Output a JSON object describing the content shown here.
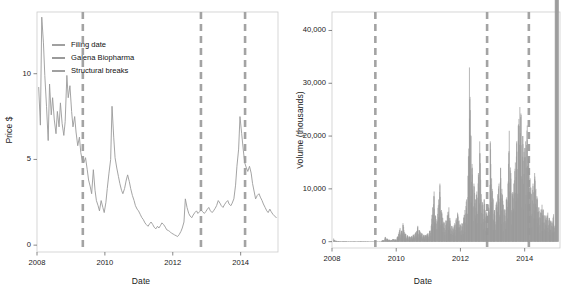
{
  "figure": {
    "background": "#ffffff",
    "series_color": "#9a9a9a",
    "break_color": "#a3a3a3",
    "frame_color": "#cccccc"
  },
  "legend": {
    "items": [
      {
        "label": "Filing date",
        "key": "line-key-filing-date"
      },
      {
        "label": "Galena Biopharma",
        "key": "line-key-galena"
      },
      {
        "label": "Structural breaks",
        "key": "line-key-breaks"
      }
    ]
  },
  "chart_data": [
    {
      "type": "line",
      "id": "price-panel",
      "title": "",
      "xlabel": "Date",
      "ylabel": "Price $",
      "xlim": [
        2008.0,
        2015.1
      ],
      "ylim": [
        -0.4,
        13.6
      ],
      "xticks": [
        2008,
        2010,
        2012,
        2014
      ],
      "xtick_labels": [
        "2008",
        "2010",
        "2012",
        "2014"
      ],
      "yticks": [
        0,
        5,
        10
      ],
      "ytick_labels": [
        "0",
        "5",
        "10"
      ],
      "grid": false,
      "legend_position": "top-left",
      "vlines": [
        2009.35,
        2012.83,
        2014.13
      ],
      "vline_style": "dashed",
      "x": [
        2008.05,
        2008.1,
        2008.14,
        2008.19,
        2008.23,
        2008.28,
        2008.33,
        2008.37,
        2008.42,
        2008.46,
        2008.51,
        2008.56,
        2008.6,
        2008.65,
        2008.69,
        2008.74,
        2008.79,
        2008.83,
        2008.88,
        2008.92,
        2008.97,
        2009.02,
        2009.06,
        2009.11,
        2009.15,
        2009.2,
        2009.25,
        2009.29,
        2009.34,
        2009.38,
        2009.43,
        2009.48,
        2009.52,
        2009.57,
        2009.61,
        2009.66,
        2009.71,
        2009.75,
        2009.8,
        2009.84,
        2009.89,
        2009.94,
        2009.98,
        2010.03,
        2010.07,
        2010.12,
        2010.17,
        2010.21,
        2010.26,
        2010.3,
        2010.35,
        2010.4,
        2010.44,
        2010.49,
        2010.53,
        2010.58,
        2010.63,
        2010.67,
        2010.72,
        2010.76,
        2010.81,
        2010.86,
        2010.9,
        2010.95,
        2010.99,
        2011.04,
        2011.09,
        2011.13,
        2011.18,
        2011.22,
        2011.27,
        2011.32,
        2011.36,
        2011.41,
        2011.45,
        2011.5,
        2011.55,
        2011.59,
        2011.64,
        2011.68,
        2011.73,
        2011.78,
        2011.82,
        2011.87,
        2011.91,
        2011.96,
        2012.01,
        2012.05,
        2012.1,
        2012.14,
        2012.19,
        2012.24,
        2012.28,
        2012.33,
        2012.37,
        2012.42,
        2012.47,
        2012.51,
        2012.56,
        2012.6,
        2012.65,
        2012.7,
        2012.74,
        2012.79,
        2012.83,
        2012.88,
        2012.93,
        2012.97,
        2013.02,
        2013.06,
        2013.11,
        2013.16,
        2013.2,
        2013.25,
        2013.29,
        2013.34,
        2013.39,
        2013.43,
        2013.48,
        2013.52,
        2013.57,
        2013.62,
        2013.66,
        2013.71,
        2013.75,
        2013.8,
        2013.85,
        2013.89,
        2013.94,
        2013.98,
        2014.03,
        2014.08,
        2014.12,
        2014.17,
        2014.21,
        2014.26,
        2014.31,
        2014.35,
        2014.4,
        2014.44,
        2014.49,
        2014.54,
        2014.58,
        2014.63,
        2014.67,
        2014.72,
        2014.77,
        2014.81,
        2014.86,
        2014.9,
        2014.95,
        2015.0,
        2015.05
      ],
      "y": [
        9.2,
        7.0,
        13.3,
        11.8,
        9.9,
        8.1,
        6.1,
        9.4,
        7.6,
        8.6,
        7.3,
        6.5,
        7.8,
        6.9,
        8.3,
        7.1,
        6.4,
        7.2,
        9.9,
        8.6,
        9.3,
        7.8,
        6.9,
        7.5,
        6.6,
        5.8,
        6.3,
        5.4,
        4.9,
        4.8,
        5.1,
        4.4,
        3.8,
        3.4,
        3.0,
        4.4,
        3.2,
        2.6,
        2.3,
        2.0,
        2.6,
        2.2,
        1.9,
        2.5,
        3.3,
        4.2,
        5.0,
        8.1,
        6.3,
        5.1,
        4.5,
        4.0,
        3.6,
        3.2,
        3.0,
        3.3,
        3.8,
        4.1,
        3.7,
        3.3,
        2.9,
        2.6,
        2.3,
        2.1,
        2.0,
        1.8,
        1.6,
        1.5,
        1.3,
        1.2,
        1.1,
        1.25,
        1.35,
        1.2,
        1.05,
        0.95,
        1.1,
        1.0,
        1.15,
        1.3,
        1.2,
        1.05,
        0.9,
        0.85,
        0.8,
        0.7,
        0.65,
        0.6,
        0.55,
        0.5,
        0.62,
        0.8,
        1.0,
        1.35,
        2.7,
        2.2,
        1.85,
        1.7,
        1.6,
        1.75,
        1.9,
        2.0,
        1.85,
        1.95,
        2.05,
        1.95,
        1.85,
        1.95,
        2.1,
        2.2,
        2.0,
        1.9,
        2.0,
        2.15,
        2.3,
        2.6,
        2.45,
        2.3,
        2.2,
        2.35,
        2.5,
        2.6,
        2.4,
        2.3,
        2.45,
        2.7,
        3.5,
        4.6,
        5.6,
        7.5,
        6.5,
        5.5,
        4.8,
        4.5,
        4.3,
        4.6,
        4.2,
        3.6,
        3.1,
        2.7,
        2.9,
        3.0,
        2.8,
        2.6,
        2.4,
        2.2,
        2.0,
        1.9,
        2.1,
        1.95,
        1.8,
        1.7,
        1.6,
        1.55
      ]
    },
    {
      "type": "line",
      "id": "volume-panel",
      "title": "",
      "xlabel": "Date",
      "ylabel": "Volume (thousands)",
      "xlim": [
        2008.0,
        2015.1
      ],
      "ylim": [
        -1200,
        43500
      ],
      "xticks": [
        2008,
        2010,
        2012,
        2014
      ],
      "xtick_labels": [
        "2008",
        "2010",
        "2012",
        "2014"
      ],
      "yticks": [
        0,
        10000,
        20000,
        30000,
        40000
      ],
      "ytick_labels": [
        "0",
        "10,000",
        "20,000",
        "30,000",
        "40,000"
      ],
      "grid": false,
      "legend_position": "none",
      "vlines": [
        2009.35,
        2012.83,
        2014.13
      ],
      "vline_style": "dashed",
      "peak_max": 33000,
      "x": [
        2008.05,
        2008.1,
        2008.14,
        2008.19,
        2008.23,
        2008.28,
        2008.33,
        2008.37,
        2008.42,
        2008.46,
        2008.51,
        2008.56,
        2008.6,
        2008.65,
        2008.69,
        2008.74,
        2008.79,
        2008.83,
        2008.88,
        2008.92,
        2008.97,
        2009.02,
        2009.06,
        2009.11,
        2009.15,
        2009.2,
        2009.25,
        2009.29,
        2009.34,
        2009.38,
        2009.43,
        2009.48,
        2009.52,
        2009.57,
        2009.61,
        2009.66,
        2009.71,
        2009.75,
        2009.8,
        2009.84,
        2009.89,
        2009.94,
        2009.98,
        2010.03,
        2010.07,
        2010.12,
        2010.17,
        2010.21,
        2010.26,
        2010.3,
        2010.35,
        2010.4,
        2010.44,
        2010.49,
        2010.53,
        2010.58,
        2010.63,
        2010.67,
        2010.72,
        2010.76,
        2010.81,
        2010.86,
        2010.9,
        2010.95,
        2010.99,
        2011.04,
        2011.09,
        2011.13,
        2011.18,
        2011.22,
        2011.27,
        2011.32,
        2011.36,
        2011.41,
        2011.45,
        2011.5,
        2011.55,
        2011.59,
        2011.64,
        2011.68,
        2011.73,
        2011.78,
        2011.82,
        2011.87,
        2011.91,
        2011.96,
        2012.01,
        2012.05,
        2012.1,
        2012.14,
        2012.19,
        2012.24,
        2012.28,
        2012.33,
        2012.37,
        2012.42,
        2012.47,
        2012.51,
        2012.56,
        2012.6,
        2012.65,
        2012.7,
        2012.74,
        2012.79,
        2012.83,
        2012.88,
        2012.93,
        2012.97,
        2013.02,
        2013.06,
        2013.11,
        2013.16,
        2013.2,
        2013.25,
        2013.29,
        2013.34,
        2013.39,
        2013.43,
        2013.48,
        2013.52,
        2013.57,
        2013.62,
        2013.66,
        2013.71,
        2013.75,
        2013.8,
        2013.85,
        2013.89,
        2013.94,
        2013.98,
        2014.03,
        2014.08,
        2014.12,
        2014.17,
        2014.21,
        2014.26,
        2014.31,
        2014.35,
        2014.4,
        2014.44,
        2014.49,
        2014.54,
        2014.58,
        2014.63,
        2014.67,
        2014.72,
        2014.77,
        2014.81,
        2014.86,
        2014.9,
        2014.95,
        2015.0,
        2015.05
      ],
      "y": [
        600,
        200,
        150,
        120,
        100,
        90,
        80,
        110,
        95,
        85,
        70,
        60,
        75,
        65,
        80,
        70,
        60,
        70,
        95,
        85,
        90,
        75,
        65,
        70,
        60,
        55,
        60,
        50,
        45,
        40,
        50,
        45,
        40,
        300,
        250,
        900,
        600,
        400,
        350,
        300,
        500,
        450,
        400,
        800,
        1500,
        2600,
        2100,
        3500,
        1800,
        1400,
        1200,
        1000,
        900,
        1100,
        1300,
        1500,
        2000,
        3000,
        2200,
        1800,
        1500,
        1300,
        1200,
        1400,
        1600,
        2000,
        3000,
        6500,
        9500,
        5000,
        4000,
        8000,
        11000,
        6000,
        4500,
        3500,
        4000,
        5000,
        6500,
        4000,
        3000,
        2500,
        3500,
        4500,
        5500,
        4000,
        3000,
        3500,
        4500,
        6000,
        8000,
        12500,
        33000,
        20000,
        14000,
        11000,
        8000,
        9500,
        13000,
        19000,
        9000,
        7000,
        8000,
        6000,
        5000,
        7000,
        19000,
        12000,
        8000,
        6000,
        7000,
        9000,
        11000,
        14000,
        10000,
        7000,
        6000,
        8000,
        11000,
        21000,
        13000,
        9000,
        11000,
        15000,
        19000,
        22000,
        25500,
        24000,
        20000,
        17000,
        19000,
        22000,
        16000,
        12000,
        9000,
        11000,
        13000,
        10000,
        8000,
        6500,
        5500,
        7000,
        6000,
        5000,
        4500,
        5500,
        4500,
        4000,
        3500,
        5200,
        3000
      ]
    }
  ]
}
